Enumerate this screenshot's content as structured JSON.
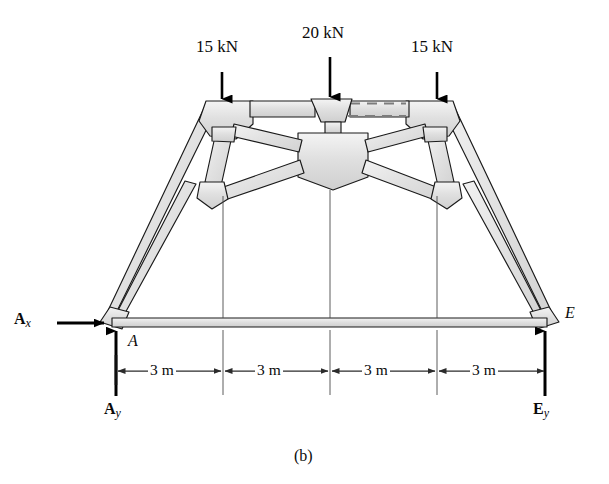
{
  "figure": {
    "caption": "(b)",
    "type": "truss-free-body-diagram"
  },
  "loads": [
    {
      "id": "load-left",
      "label": "15 kN",
      "magnitude": 15,
      "unit": "kN",
      "direction": "down",
      "at_node": "B"
    },
    {
      "id": "load-center",
      "label": "20 kN",
      "magnitude": 20,
      "unit": "kN",
      "direction": "down",
      "at_node": "C"
    },
    {
      "id": "load-right",
      "label": "15 kN",
      "magnitude": 15,
      "unit": "kN",
      "direction": "down",
      "at_node": "D"
    }
  ],
  "reactions": [
    {
      "id": "reaction-ax",
      "symbol": "A",
      "subscript": "x",
      "at_node": "A",
      "direction": "right"
    },
    {
      "id": "reaction-ay",
      "symbol": "A",
      "subscript": "y",
      "at_node": "A",
      "direction": "up"
    },
    {
      "id": "reaction-ey",
      "symbol": "E",
      "subscript": "y",
      "at_node": "E",
      "direction": "up"
    }
  ],
  "nodes": [
    {
      "id": "node-a",
      "label": "A"
    },
    {
      "id": "node-e",
      "label": "E"
    }
  ],
  "dimensions": {
    "unit": "m",
    "segments": [
      {
        "id": "dim-1",
        "label": "3 m",
        "value": 3
      },
      {
        "id": "dim-2",
        "label": "3 m",
        "value": 3
      },
      {
        "id": "dim-3",
        "label": "3 m",
        "value": 3
      },
      {
        "id": "dim-4",
        "label": "3 m",
        "value": 3
      }
    ],
    "total_span_label": "12 m"
  },
  "colors": {
    "member_fill": "#e2e2e2",
    "member_fill_light": "#efefef",
    "outline": "#1a1a1a",
    "arrow": "#000000",
    "dim_line": "#2b2b2b",
    "background": "#ffffff"
  }
}
